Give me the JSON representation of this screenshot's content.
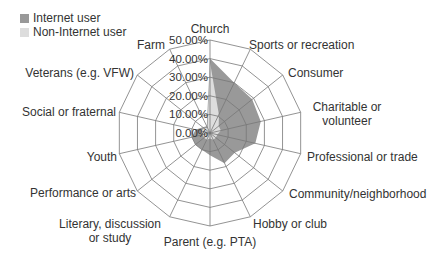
{
  "chart_data": {
    "type": "radar",
    "title": "",
    "categories": [
      "Church",
      "Sports or recreation",
      "Consumer",
      "Charitable or volunteer",
      "Professional or trade",
      "Community/neighborhood",
      "Hobby or club",
      "Parent (e.g. PTA)",
      "Literary, discussion or study",
      "Performance or arts",
      "Youth",
      "Social or fraternal",
      "Veterans (e.g. VFW)",
      "Farm"
    ],
    "series": [
      {
        "name": "Internet user",
        "color": "#999999",
        "values": [
          40,
          30,
          29,
          28,
          25,
          17,
          18,
          12,
          10,
          10,
          10,
          8,
          5,
          4
        ]
      },
      {
        "name": "Non-Internet user",
        "color": "#dddddd",
        "values": [
          38,
          11,
          6,
          6,
          4,
          4,
          4,
          3,
          4,
          4,
          4,
          5,
          4,
          3
        ]
      }
    ],
    "radial_ticks": [
      "0.00%",
      "10.00%",
      "20.00%",
      "30.00%",
      "40.00%",
      "50.00%"
    ],
    "rlim": [
      0,
      50
    ],
    "grid": true,
    "legend_position": "top-left"
  },
  "legend": {
    "items": [
      {
        "label": "Internet user",
        "color": "#999999"
      },
      {
        "label": "Non-Internet user",
        "color": "#dddddd"
      }
    ]
  }
}
